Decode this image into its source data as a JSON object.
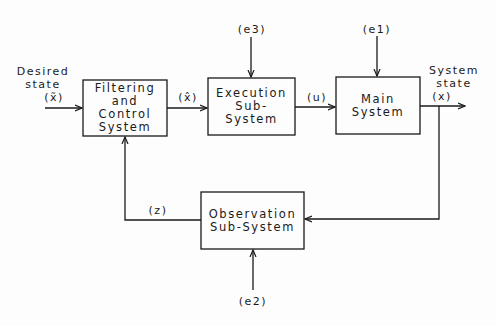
{
  "diagram": {
    "type": "block-diagram",
    "colors": {
      "line": "#1a1a1a",
      "background": "#fdfdfd"
    },
    "blocks": [
      {
        "id": "filtering",
        "lines": [
          "Filtering",
          "and",
          "Control",
          "System"
        ]
      },
      {
        "id": "execution",
        "lines": [
          "Execution",
          "Sub-",
          "System"
        ]
      },
      {
        "id": "main",
        "lines": [
          "Main",
          "System"
        ]
      },
      {
        "id": "observation",
        "lines": [
          "Observation",
          "Sub-System"
        ]
      }
    ],
    "signals": {
      "desired_state": {
        "lines": [
          "Desired",
          "state",
          "(x̃)"
        ]
      },
      "estimated_state": "(x̂)",
      "control": "(u)",
      "system_state": {
        "lines": [
          "System",
          "state",
          "(x)"
        ]
      },
      "observation": "(z)",
      "e1": "(e1)",
      "e2": "(e2)",
      "e3": "(e3)"
    },
    "connections": [
      {
        "from": "desired_state",
        "to": "filtering"
      },
      {
        "from": "filtering",
        "to": "execution",
        "label": "(x̂)"
      },
      {
        "from": "execution",
        "to": "main",
        "label": "(u)"
      },
      {
        "from": "main",
        "to": "system_state",
        "label": "(x)"
      },
      {
        "from": "system_state",
        "to": "observation"
      },
      {
        "from": "observation",
        "to": "filtering",
        "label": "(z)"
      },
      {
        "from": "e3",
        "to": "execution"
      },
      {
        "from": "e1",
        "to": "main"
      },
      {
        "from": "e2",
        "to": "observation"
      }
    ]
  }
}
